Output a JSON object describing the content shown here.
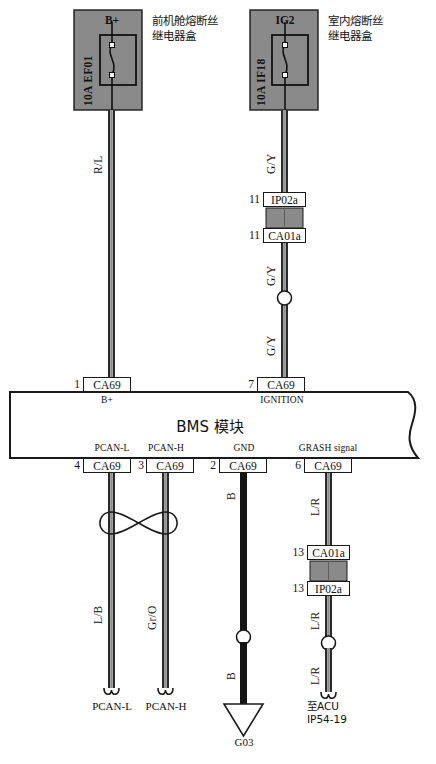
{
  "diagram": {
    "title": "BMS 模块",
    "module_label": "BMS 模块"
  },
  "fuse_boxes": [
    {
      "id": "front-engine-fuse-relay-box",
      "caption": "前机舱熔断丝\n继电器盒",
      "fuse_rating": "10A EF01",
      "output_label": "B+"
    },
    {
      "id": "interior-fuse-relay-box",
      "caption": "室内熔断丝\n继电器盒",
      "fuse_rating": "10A IF18",
      "output_label": "IG2"
    }
  ],
  "connectors": {
    "top_left": {
      "pin": "1",
      "name": "CA69",
      "function": "B+"
    },
    "top_right": {
      "pin": "7",
      "name": "CA69",
      "function": "IGNITION"
    },
    "inline_top_upper": {
      "pin": "11",
      "name": "IP02a"
    },
    "inline_top_lower": {
      "pin": "11",
      "name": "CA01a"
    },
    "inline_bottom_upper": {
      "pin": "13",
      "name": "CA01a"
    },
    "inline_bottom_lower": {
      "pin": "13",
      "name": "IP02a"
    },
    "bottom": [
      {
        "pin": "4",
        "name": "CA69",
        "function": "PCAN-L"
      },
      {
        "pin": "3",
        "name": "CA69",
        "function": "PCAN-H"
      },
      {
        "pin": "2",
        "name": "CA69",
        "function": "GND"
      },
      {
        "pin": "6",
        "name": "CA69",
        "function": "GRASH signal"
      }
    ]
  },
  "wires": [
    {
      "id": "w-b-plus",
      "color_code": "R/L"
    },
    {
      "id": "w-ig2-upper",
      "color_code": "G/Y"
    },
    {
      "id": "w-ig2-mid",
      "color_code": "G/Y"
    },
    {
      "id": "w-ig2-lower",
      "color_code": "G/Y"
    },
    {
      "id": "w-pcan-l",
      "color_code": "L/B"
    },
    {
      "id": "w-pcan-h",
      "color_code": "Gr/O"
    },
    {
      "id": "w-gnd-upper",
      "color_code": "B"
    },
    {
      "id": "w-gnd-lower",
      "color_code": "B"
    },
    {
      "id": "w-crash-upper",
      "color_code": "L/R"
    },
    {
      "id": "w-crash-mid",
      "color_code": "L/R"
    },
    {
      "id": "w-crash-lower",
      "color_code": "L/R"
    }
  ],
  "terminations": [
    {
      "id": "term-pcan-l",
      "label": "PCAN-L"
    },
    {
      "id": "term-pcan-h",
      "label": "PCAN-H"
    },
    {
      "id": "term-ground",
      "label": "G03"
    },
    {
      "id": "term-acu",
      "label": "至ACU\nIP54-19"
    }
  ],
  "colors": {
    "fuse_box_fill": "#8a8a8a",
    "connector_gray_fill": "#8a8a8a",
    "wire_outline": "#2b2b2b",
    "wire_fill": "#9a9a9a",
    "wire_black": "#151515",
    "line": "#1a1a1a",
    "background": "#ffffff"
  }
}
